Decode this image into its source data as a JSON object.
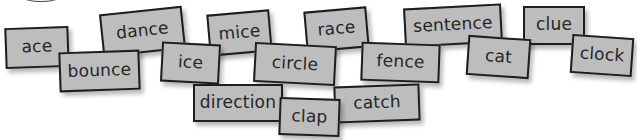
{
  "cards": [
    {
      "word": "ace",
      "x": 5,
      "y": 27,
      "w": 64,
      "h": 41,
      "rot": -2,
      "z": 1
    },
    {
      "word": "dance",
      "x": 101,
      "y": 10,
      "w": 83,
      "h": 43,
      "rot": -6,
      "z": 2
    },
    {
      "word": "bounce",
      "x": 59,
      "y": 51,
      "w": 81,
      "h": 40,
      "rot": -2,
      "z": 3
    },
    {
      "word": "mice",
      "x": 208,
      "y": 12,
      "w": 63,
      "h": 42,
      "rot": -5,
      "z": 2
    },
    {
      "word": "ice",
      "x": 161,
      "y": 43,
      "w": 59,
      "h": 40,
      "rot": 3,
      "z": 3
    },
    {
      "word": "race",
      "x": 305,
      "y": 9,
      "w": 63,
      "h": 41,
      "rot": -5,
      "z": 2
    },
    {
      "word": "circle",
      "x": 254,
      "y": 44,
      "w": 82,
      "h": 40,
      "rot": 3,
      "z": 3
    },
    {
      "word": "direction",
      "x": 193,
      "y": 84,
      "w": 90,
      "h": 38,
      "rot": 0,
      "z": 4
    },
    {
      "word": "clap",
      "x": 279,
      "y": 98,
      "w": 61,
      "h": 38,
      "rot": 2,
      "z": 5
    },
    {
      "word": "sentence",
      "x": 404,
      "y": 6,
      "w": 98,
      "h": 39,
      "rot": -3,
      "z": 2
    },
    {
      "word": "fence",
      "x": 361,
      "y": 43,
      "w": 79,
      "h": 39,
      "rot": 2,
      "z": 3
    },
    {
      "word": "catch",
      "x": 334,
      "y": 85,
      "w": 86,
      "h": 37,
      "rot": -2,
      "z": 4
    },
    {
      "word": "cat",
      "x": 467,
      "y": 37,
      "w": 63,
      "h": 40,
      "rot": 4,
      "z": 3
    },
    {
      "word": "clue",
      "x": 523,
      "y": 6,
      "w": 62,
      "h": 39,
      "rot": 0,
      "z": 2
    },
    {
      "word": "clock",
      "x": 571,
      "y": 36,
      "w": 62,
      "h": 39,
      "rot": 4,
      "z": 3
    }
  ],
  "colors": {
    "card_fill": "#bdbdbd",
    "card_border": "#1e1e1e",
    "text": "#262626",
    "background": "#ffffff"
  }
}
